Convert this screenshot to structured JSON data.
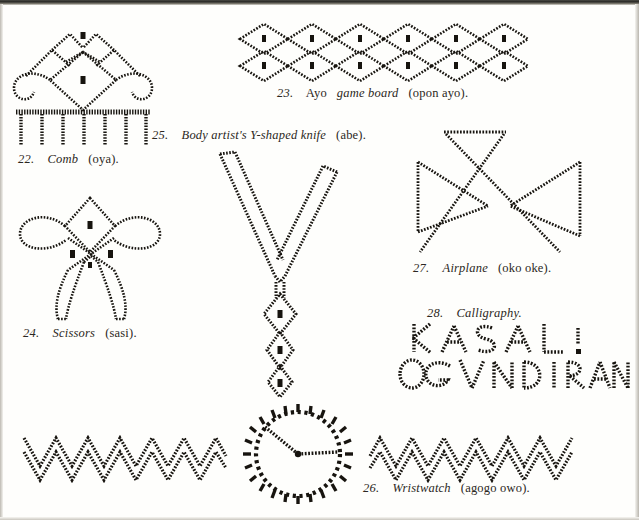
{
  "page": {
    "background": "#fefefc",
    "ink_color": "#17140f",
    "type": "book-plate-line-drawings"
  },
  "figures": [
    {
      "id": "comb",
      "number": "22.",
      "name_italic": "Comb",
      "name_roman": "(oya).",
      "caption": "22.  Comb (oya).",
      "motif": "comb-with-crest-and-seven-teeth"
    },
    {
      "id": "ayo-game-board",
      "number": "23.",
      "name_roman_lead": "Ayo",
      "name_italic": "game board",
      "name_roman": "(opon ayo).",
      "caption": "23.  Ayo game board (opon ayo).",
      "motif": "two-rows-of-six-diamonds",
      "rows": 2,
      "columns": 6
    },
    {
      "id": "scissors",
      "number": "24.",
      "name_italic": "Scissors",
      "name_roman": "(sasi).",
      "caption": "24.  Scissors (sasi).",
      "motif": "scissors-with-looped-handles"
    },
    {
      "id": "y-shaped-knife",
      "number": "25.",
      "name_italic": "Body artist's Y-shaped knife",
      "name_roman": "(abe).",
      "caption": "25.  Body artist's Y-shaped knife (abe).",
      "motif": "y-blade-with-three-stacked-diamonds"
    },
    {
      "id": "wristwatch",
      "number": "26.",
      "name_italic": "Wristwatch",
      "name_roman": "(agogo owo).",
      "caption": "26.  Wristwatch (agogo owo).",
      "motif": "zigzag-bands-with-radiant-dial"
    },
    {
      "id": "airplane",
      "number": "27.",
      "name_italic": "Airplane",
      "name_roman": "(oko oke).",
      "caption": "27.  Airplane (oko oke).",
      "motif": "crossed-bowtie-with-tail-bar"
    },
    {
      "id": "calligraphy",
      "number": "28.",
      "name_italic": "Calligraphy.",
      "caption": "28.  Calligraphy.",
      "motif": "stitched-capital-letters",
      "lines": [
        "K A S A L I",
        "O G V N D I R A N"
      ]
    }
  ]
}
